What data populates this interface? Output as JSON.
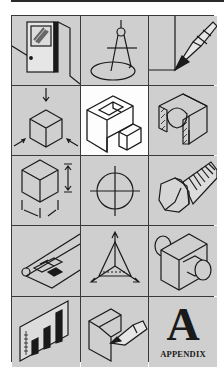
{
  "colors": {
    "cell_bg": "#cfcfcf",
    "selected_bg": "#fdfdfd",
    "grid_line": "#3a3a3a",
    "ink": "#1a1a1a"
  },
  "grid": {
    "rows": 5,
    "columns": 3,
    "selected_index": 4,
    "tiles": [
      {
        "icon": "door-icon"
      },
      {
        "icon": "compass-icon"
      },
      {
        "icon": "pencil-sketch-icon"
      },
      {
        "icon": "cube-projection-icon"
      },
      {
        "icon": "isometric-block-icon"
      },
      {
        "icon": "section-view-icon"
      },
      {
        "icon": "cube-dimension-icon"
      },
      {
        "icon": "centerline-circle-icon"
      },
      {
        "icon": "bolt-icon"
      },
      {
        "icon": "blueprint-scroll-icon"
      },
      {
        "icon": "axes-triangle-icon"
      },
      {
        "icon": "cylinder-block-icon"
      },
      {
        "icon": "bar-chart-icon"
      },
      {
        "icon": "pencil-on-block-icon"
      },
      {
        "icon": "appendix-icon",
        "letter": "A",
        "label": "APPENDIX"
      }
    ]
  }
}
